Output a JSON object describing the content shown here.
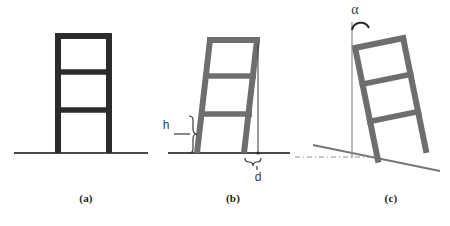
{
  "figure": {
    "type": "engineering-diagram",
    "background_color": "#ffffff",
    "width": 450,
    "height": 226
  },
  "colors": {
    "frame_dark": "#2b2b2b",
    "frame_gray": "#6e6e6e",
    "ground_line": "#4a4a4a",
    "ground_line_gray": "#777777",
    "annotation": "#3a3a3a",
    "reference_line": "#8d8d8d",
    "label_text": "#1d1d1d"
  },
  "panels": [
    {
      "id": "a",
      "label": "(a)",
      "label_x": 66,
      "label_y": 192,
      "description": "undeformed upright three-storey frame",
      "color": "#2b2b2b",
      "member_width": 6,
      "storeys": 3,
      "frame": {
        "left": 55,
        "right": 112,
        "top": 33,
        "base": 153,
        "beam_levels": [
          33,
          72,
          110
        ]
      },
      "ground": {
        "x1": 14,
        "y1": 153,
        "x2": 148,
        "y2": 153
      },
      "annotations": []
    },
    {
      "id": "b",
      "label": "(b)",
      "label_x": 213,
      "label_y": 192,
      "description": "shear / racking deformation with storey drift",
      "color": "#6e6e6e",
      "member_width": 6,
      "storeys": 3,
      "frame": {
        "base_left": 196,
        "base_right": 245,
        "top_left": 210,
        "top_right": 258,
        "top": 38,
        "base": 153,
        "beam_levels": [
          38,
          76,
          114
        ]
      },
      "ground": {
        "x1": 168,
        "y1": 153,
        "x2": 290,
        "y2": 153
      },
      "annotations": [
        {
          "name": "storey-height",
          "symbol": "h",
          "label_x": 166,
          "label_y": 126,
          "brace_orientation": "vertical",
          "brace_x": 193,
          "brace_y_top": 116,
          "brace_y_bottom": 153,
          "leader_x1": 174,
          "leader_x2": 188,
          "leader_y": 134
        },
        {
          "name": "drift-displacement",
          "symbol": "d",
          "label_x": 249,
          "label_y": 177,
          "brace_orientation": "horizontal",
          "brace_y": 161,
          "brace_x_left": 245,
          "brace_x_right": 262,
          "plumb_line_x_top": 258,
          "plumb_line_y_top": 42,
          "plumb_line_x_bottom": 258,
          "plumb_line_y_bottom": 153
        }
      ]
    },
    {
      "id": "c",
      "label": "(c)",
      "label_x": 371,
      "label_y": 192,
      "description": "rigid-body rotation on tilted foundation",
      "color": "#6e6e6e",
      "member_width": 6,
      "storeys": 3,
      "frame": {
        "base_left": 356,
        "base_right": 404,
        "top_left": 371,
        "top_right": 420,
        "top": 40,
        "base_left_y": 155,
        "base_right_y": 165,
        "beam_levels": [
          40,
          78,
          116
        ]
      },
      "ground": {
        "x1": 313,
        "y1": 145,
        "x2": 440,
        "y2": 171
      },
      "reference_line": {
        "x1": 295,
        "y1": 157,
        "x2": 375,
        "y2": 157,
        "style": "dash-dot"
      },
      "annotations": [
        {
          "name": "rotation-angle",
          "symbol": "α",
          "label_x": 352,
          "label_y": 4,
          "vertical_reference": {
            "x": 352,
            "y_top": 22,
            "y_bottom": 158
          },
          "arc": {
            "cx": 360,
            "cy": 26,
            "r": 9,
            "from": 180,
            "to": 360
          }
        }
      ]
    }
  ]
}
